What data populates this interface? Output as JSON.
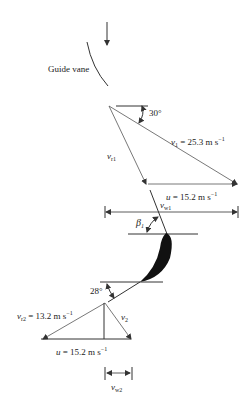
{
  "diagram": {
    "guide_vane_label": "Guide vane",
    "inlet": {
      "angle_label": "30°",
      "v1_sym": "v",
      "v1_sub": "1",
      "v1_value": " = 25.3 m s",
      "v1_exp": "−1",
      "vr1_sym": "v",
      "vr1_sub": "r1",
      "u_sym": "u",
      "u_value": " = 15.2 m s",
      "u_exp": "−1",
      "vw1_sym": "v",
      "vw1_sub": "w1",
      "beta_sym": "β",
      "beta_sub": "1"
    },
    "outlet": {
      "angle_label": "28°",
      "vr2_sym": "v",
      "vr2_sub": "r2",
      "vr2_value": " = 13.2 m s",
      "vr2_exp": "−1",
      "v2_sym": "v",
      "v2_sub": "2",
      "u_sym": "u",
      "u_value": " = 15.2 m s",
      "u_exp": "−1",
      "vw2_sym": "v",
      "vw2_sub": "w2"
    }
  }
}
